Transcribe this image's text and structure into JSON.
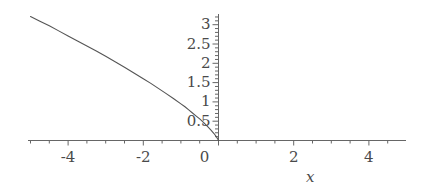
{
  "chart_data": {
    "type": "line",
    "title": "",
    "subtitle": "",
    "xlabel": "x",
    "ylabel": "",
    "xlim": [
      -5.2,
      5.0
    ],
    "ylim": [
      -0.12,
      3.35
    ],
    "grid": false,
    "legend": null,
    "background_color": "#ffffff",
    "curve_color": "#555555",
    "axis_color": "#666666",
    "text_color": "#4a4a4a",
    "x_ticks": [
      {
        "value": -4,
        "label": "-4"
      },
      {
        "value": -2,
        "label": "-2"
      },
      {
        "value": 0,
        "label": "0"
      },
      {
        "value": 2,
        "label": "2"
      },
      {
        "value": 4,
        "label": "4"
      }
    ],
    "x_minor_tick_step": 0.5,
    "y_ticks": [
      {
        "value": 0.5,
        "label": "0.5"
      },
      {
        "value": 1,
        "label": "1"
      },
      {
        "value": 1.5,
        "label": "1.5"
      },
      {
        "value": 2,
        "label": "2"
      },
      {
        "value": 2.5,
        "label": "2.5"
      },
      {
        "value": 3,
        "label": "3"
      }
    ],
    "y_minor_tick_step": 0.1,
    "series": [
      {
        "name": "curve",
        "description": "increasing-magnitude curve in the second quadrant, passing through the origin, defined only for x <= 0",
        "points": [
          [
            -5.0,
            3.21
          ],
          [
            -4.75,
            3.09
          ],
          [
            -4.5,
            2.97
          ],
          [
            -4.25,
            2.84
          ],
          [
            -4.0,
            2.71
          ],
          [
            -3.75,
            2.58
          ],
          [
            -3.5,
            2.45
          ],
          [
            -3.25,
            2.32
          ],
          [
            -3.0,
            2.18
          ],
          [
            -2.75,
            2.04
          ],
          [
            -2.5,
            1.9
          ],
          [
            -2.25,
            1.75
          ],
          [
            -2.0,
            1.6
          ],
          [
            -1.8,
            1.48
          ],
          [
            -1.6,
            1.35
          ],
          [
            -1.4,
            1.22
          ],
          [
            -1.2,
            1.09
          ],
          [
            -1.0,
            0.95
          ],
          [
            -0.9,
            0.88
          ],
          [
            -0.8,
            0.8
          ],
          [
            -0.7,
            0.72
          ],
          [
            -0.6,
            0.64
          ],
          [
            -0.5,
            0.56
          ],
          [
            -0.4,
            0.47
          ],
          [
            -0.3,
            0.37
          ],
          [
            -0.2,
            0.27
          ],
          [
            -0.12,
            0.18
          ],
          [
            -0.06,
            0.1
          ],
          [
            -0.02,
            0.04
          ],
          [
            0.0,
            0.0
          ]
        ]
      }
    ]
  },
  "axis_label": {
    "x": "x"
  }
}
